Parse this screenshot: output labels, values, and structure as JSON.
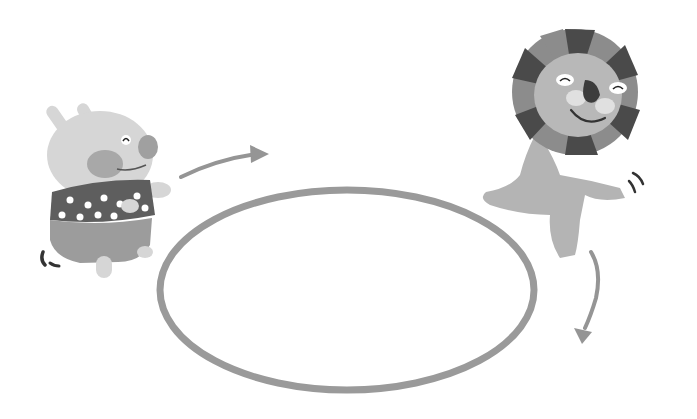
{
  "scene": {
    "description": "Grayscale illustration: a pig in a star shirt and a lion running around a hoop",
    "colors": {
      "background": "#ffffff",
      "hoop": "#9a9a9a",
      "arrow": "#959595",
      "pig_body": "#d6d6d6",
      "pig_cheek": "#a8a8a8",
      "pig_nose": "#a0a0a0",
      "shirt": "#5e5e5e",
      "shorts": "#9c9c9c",
      "lion_body": "#b4b4b4",
      "lion_face": "#b8b8b8",
      "mane_dark": "#4a4a4a",
      "mane_light": "#8c8c8c",
      "lion_nose": "#3c3c3c",
      "motion_marks": "#333333"
    }
  }
}
